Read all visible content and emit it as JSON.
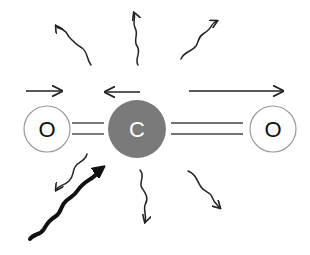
{
  "diagram": {
    "molecule": {
      "atoms": [
        {
          "id": "oxygen-left",
          "label": "O",
          "cx": 47,
          "cy": 129,
          "r": 23,
          "fill": "#ffffff",
          "stroke": "#999999",
          "text_color": "#111111"
        },
        {
          "id": "carbon",
          "label": "C",
          "cx": 137,
          "cy": 129,
          "r": 29,
          "fill": "#7a7a7a",
          "stroke": "#7a7a7a",
          "text_color": "#ffffff"
        },
        {
          "id": "oxygen-right",
          "label": "O",
          "cx": 273,
          "cy": 129,
          "r": 23,
          "fill": "#ffffff",
          "stroke": "#999999",
          "text_color": "#111111"
        }
      ],
      "bonds": [
        {
          "id": "bond-left",
          "type": "double",
          "x1": 72,
          "x2": 104,
          "y_top": 123,
          "y_bottom": 134
        },
        {
          "id": "bond-right",
          "type": "double",
          "x1": 171,
          "x2": 243,
          "y_top": 123,
          "y_bottom": 134
        }
      ]
    },
    "motion_arrows": [
      {
        "id": "arrow-left-oxygen",
        "direction": "right",
        "x1": 26,
        "x2": 62,
        "y": 91
      },
      {
        "id": "arrow-carbon",
        "direction": "left",
        "x1": 140,
        "x2": 105,
        "y": 91
      },
      {
        "id": "arrow-right-oxygen",
        "direction": "right",
        "x1": 189,
        "x2": 283,
        "y": 91
      }
    ],
    "emitted_photons": [
      {
        "id": "photon-up-left",
        "direction": "up-left"
      },
      {
        "id": "photon-up",
        "direction": "up"
      },
      {
        "id": "photon-up-right",
        "direction": "up-right"
      },
      {
        "id": "photon-down-left",
        "direction": "down-left"
      },
      {
        "id": "photon-down",
        "direction": "down"
      },
      {
        "id": "photon-down-right",
        "direction": "down-right"
      }
    ],
    "incoming_photon": {
      "id": "photon-incoming",
      "direction": "up-right",
      "weight": "bold"
    },
    "colors": {
      "line": "#222222",
      "bond": "#444444",
      "carbon": "#7a7a7a",
      "oxygen_stroke": "#999999",
      "background": "#ffffff"
    }
  }
}
